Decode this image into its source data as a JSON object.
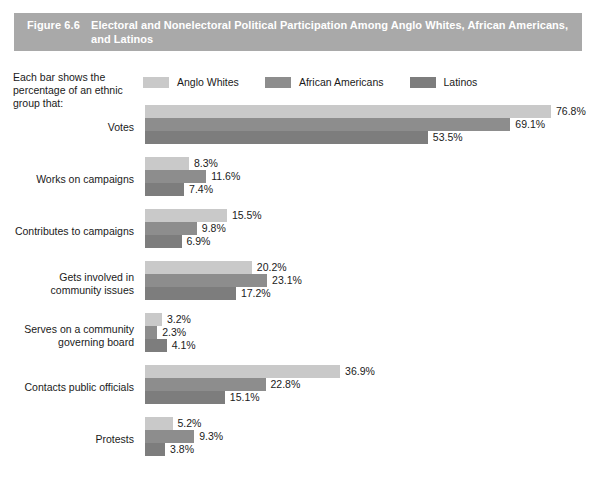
{
  "figure": {
    "number": "Figure 6.6",
    "title": "Electoral and Nonelectoral Political Participation Among Anglo Whites, African Americans, and Latinos"
  },
  "note": "Each bar shows the percentage of an ethnic group that:",
  "colors": {
    "banner": "#a9a9a9",
    "anglo_whites": "#c9c9c9",
    "african_americans": "#8d8d8d",
    "latinos": "#7d7d7d",
    "text": "#1a1a1a"
  },
  "chart_data": {
    "type": "bar",
    "orientation": "horizontal",
    "title": "Electoral and Nonelectoral Political Participation Among Anglo Whites, African Americans, and Latinos",
    "xlabel": "",
    "ylabel": "",
    "xlim": [
      0,
      76.8
    ],
    "grid": false,
    "legend_position": "top",
    "value_suffix": "%",
    "categories": [
      "Votes",
      "Works on campaigns",
      "Contributes to campaigns",
      "Gets involved in community issues",
      "Serves on a community governing board",
      "Contacts public officials",
      "Protests"
    ],
    "series": [
      {
        "name": "Anglo Whites",
        "color": "#c9c9c9",
        "values": [
          76.8,
          8.3,
          15.5,
          20.2,
          3.2,
          36.9,
          5.2
        ],
        "labels": [
          "76.8%",
          "8.3%",
          "15.5%",
          "20.2%",
          "3.2%",
          "36.9%",
          "5.2%"
        ]
      },
      {
        "name": "African Americans",
        "color": "#8d8d8d",
        "values": [
          69.1,
          11.6,
          9.8,
          23.1,
          2.3,
          22.8,
          9.3
        ],
        "labels": [
          "69.1%",
          "11.6%",
          "9.8%",
          "23.1%",
          "2.3%",
          "22.8%",
          "9.3%"
        ]
      },
      {
        "name": "Latinos",
        "color": "#7d7d7d",
        "values": [
          53.5,
          7.4,
          6.9,
          17.2,
          4.1,
          15.1,
          3.8
        ],
        "labels": [
          "53.5%",
          "7.4%",
          "6.9%",
          "17.2%",
          "4.1%",
          "15.1%",
          "3.8%"
        ]
      }
    ],
    "category_label_lines": [
      [
        "Votes"
      ],
      [
        "Works on campaigns"
      ],
      [
        "Contributes to campaigns"
      ],
      [
        "Gets involved in",
        "community issues"
      ],
      [
        "Serves on a community",
        "governing board"
      ],
      [
        "Contacts public officials"
      ],
      [
        "Protests"
      ]
    ]
  }
}
